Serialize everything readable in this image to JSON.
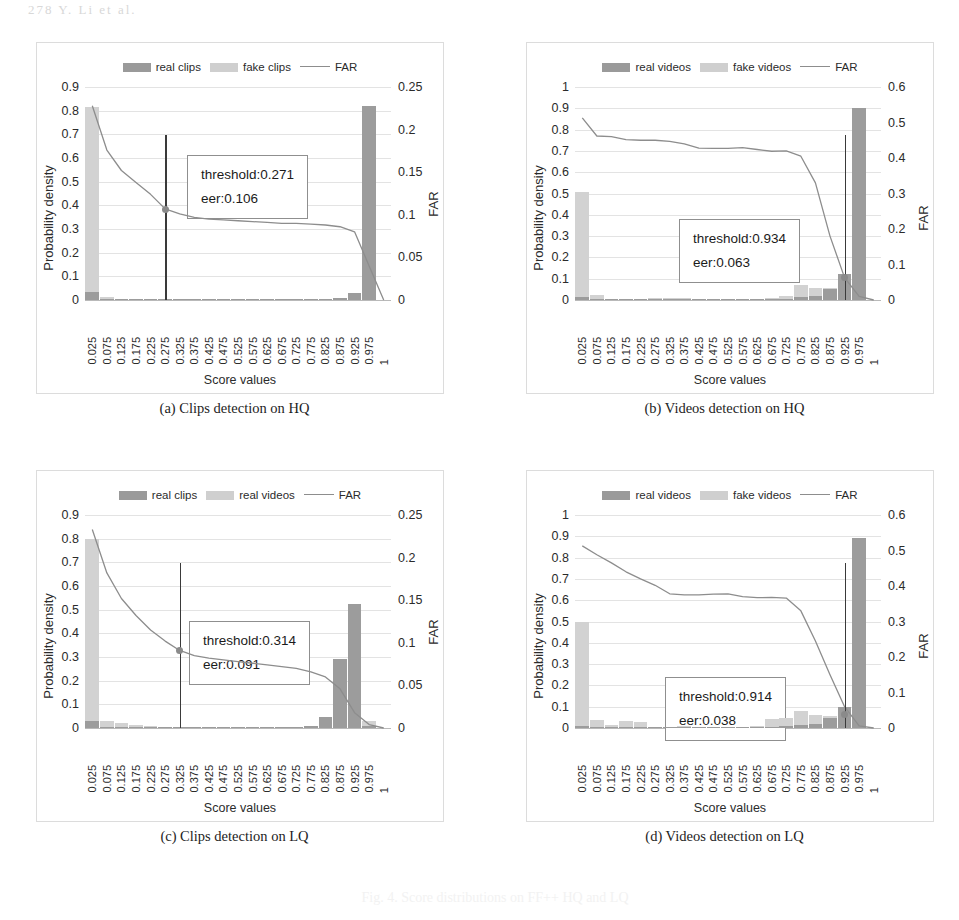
{
  "page": {
    "header_faint": "278         Y. Li et al.",
    "bleed_faint": "Fig. 4. Score distributions on FF++ HQ and LQ"
  },
  "common": {
    "xlabel": "Score values",
    "ylabel_left": "Probability density",
    "ylabel_right": "FAR",
    "xticks": [
      "0.025",
      "0.075",
      "0.125",
      "0.175",
      "0.225",
      "0.275",
      "0.325",
      "0.375",
      "0.425",
      "0.475",
      "0.525",
      "0.575",
      "0.625",
      "0.675",
      "0.725",
      "0.775",
      "0.825",
      "0.875",
      "0.925",
      "0.975",
      "1"
    ],
    "colors": {
      "real_bar": "#9c9c9c",
      "fake_bar": "#d2d2d2",
      "far_line": "#8d8d8d",
      "threshold_line": "#3a3a3a",
      "grid": "#e3e3e3",
      "panel_border": "#dcdcdc"
    }
  },
  "panels": [
    {
      "id": "a",
      "caption": "(a) Clips detection on HQ",
      "legend": [
        "real clips",
        "fake clips",
        "FAR"
      ],
      "threshold_text": "threshold:0.271",
      "eer_text": "eer:0.106",
      "yticks_left": [
        "0.9",
        "0.8",
        "0.7",
        "0.6",
        "0.5",
        "0.4",
        "0.3",
        "0.2",
        "0.1",
        "0"
      ],
      "yticks_right": [
        "0.25",
        "0.2",
        "0.15",
        "0.1",
        "0.05",
        "0"
      ]
    },
    {
      "id": "b",
      "caption": "(b) Videos detection on HQ",
      "legend": [
        "real videos",
        "fake videos",
        "FAR"
      ],
      "threshold_text": "threshold:0.934",
      "eer_text": "eer:0.063",
      "yticks_left": [
        "1",
        "0.9",
        "0.8",
        "0.7",
        "0.6",
        "0.5",
        "0.4",
        "0.3",
        "0.2",
        "0.1",
        "0"
      ],
      "yticks_right": [
        "0.6",
        "0.5",
        "0.4",
        "0.3",
        "0.2",
        "0.1",
        "0"
      ]
    },
    {
      "id": "c",
      "caption": "(c) Clips detection on LQ",
      "legend": [
        "real clips",
        "real videos",
        "FAR"
      ],
      "threshold_text": "threshold:0.314",
      "eer_text": "eer:0.091",
      "yticks_left": [
        "0.9",
        "0.8",
        "0.7",
        "0.6",
        "0.5",
        "0.4",
        "0.3",
        "0.2",
        "0.1",
        "0"
      ],
      "yticks_right": [
        "0.25",
        "0.2",
        "0.15",
        "0.1",
        "0.05",
        "0"
      ]
    },
    {
      "id": "d",
      "caption": "(d) Videos detection on LQ",
      "legend": [
        "real videos",
        "fake videos",
        "FAR"
      ],
      "threshold_text": "threshold:0.914",
      "eer_text": "eer:0.038",
      "yticks_left": [
        "1",
        "0.9",
        "0.8",
        "0.7",
        "0.6",
        "0.5",
        "0.4",
        "0.3",
        "0.2",
        "0.1",
        "0"
      ],
      "yticks_right": [
        "0.6",
        "0.5",
        "0.4",
        "0.3",
        "0.2",
        "0.1",
        "0"
      ]
    }
  ],
  "chart_data": [
    {
      "type": "bar",
      "panel": "a",
      "title": "(a) Clips detection on HQ",
      "xlabel": "Score values",
      "ylabel": "Probability density",
      "ylabel_secondary": "FAR",
      "ylim": [
        0,
        0.9
      ],
      "ylim_secondary": [
        0,
        0.25
      ],
      "grid": true,
      "legend": [
        "real clips",
        "fake clips",
        "FAR"
      ],
      "legend_position": "top-center",
      "categories": [
        "0.025",
        "0.075",
        "0.125",
        "0.175",
        "0.225",
        "0.275",
        "0.325",
        "0.375",
        "0.425",
        "0.475",
        "0.525",
        "0.575",
        "0.625",
        "0.675",
        "0.725",
        "0.775",
        "0.825",
        "0.875",
        "0.925",
        "0.975"
      ],
      "series": [
        {
          "name": "fake clips",
          "values": [
            0.815,
            0.012,
            0.004,
            0.003,
            0.003,
            0.002,
            0.002,
            0.002,
            0.002,
            0.002,
            0.002,
            0.002,
            0.002,
            0.002,
            0.002,
            0.002,
            0.002,
            0.004,
            0.02,
            0.04
          ]
        },
        {
          "name": "real clips",
          "values": [
            0.035,
            0.004,
            0.002,
            0.002,
            0.002,
            0.002,
            0.002,
            0.002,
            0.002,
            0.002,
            0.002,
            0.002,
            0.002,
            0.002,
            0.002,
            0.003,
            0.004,
            0.008,
            0.03,
            0.82
          ]
        }
      ],
      "far_curve": {
        "name": "FAR",
        "axis": "secondary",
        "x": [
          "0.025",
          "0.075",
          "0.125",
          "0.175",
          "0.225",
          "0.275",
          "0.325",
          "0.375",
          "0.425",
          "0.475",
          "0.525",
          "0.575",
          "0.625",
          "0.675",
          "0.725",
          "0.775",
          "0.825",
          "0.875",
          "0.925",
          "0.975",
          "1"
        ],
        "values": [
          0.228,
          0.176,
          0.152,
          0.138,
          0.124,
          0.107,
          0.101,
          0.097,
          0.095,
          0.094,
          0.093,
          0.092,
          0.091,
          0.09,
          0.09,
          0.089,
          0.088,
          0.086,
          0.08,
          0.04,
          0.0
        ]
      },
      "annotations": [
        {
          "text": "threshold:0.271",
          "value": 0.271
        },
        {
          "text": "eer:0.106",
          "value": 0.106
        }
      ],
      "threshold_marker": {
        "x": "0.275",
        "y_secondary": 0.106
      }
    },
    {
      "type": "bar",
      "panel": "b",
      "title": "(b) Videos detection on HQ",
      "xlabel": "Score values",
      "ylabel": "Probability density",
      "ylabel_secondary": "FAR",
      "ylim": [
        0,
        1
      ],
      "ylim_secondary": [
        0,
        0.6
      ],
      "grid": true,
      "legend": [
        "real videos",
        "fake videos",
        "FAR"
      ],
      "legend_position": "top-center",
      "categories": [
        "0.025",
        "0.075",
        "0.125",
        "0.175",
        "0.225",
        "0.275",
        "0.325",
        "0.375",
        "0.425",
        "0.475",
        "0.525",
        "0.575",
        "0.625",
        "0.675",
        "0.725",
        "0.775",
        "0.825",
        "0.875",
        "0.925",
        "0.975"
      ],
      "series": [
        {
          "name": "fake videos",
          "values": [
            0.505,
            0.022,
            0.004,
            0.004,
            0.004,
            0.01,
            0.01,
            0.01,
            0.006,
            0.004,
            0.004,
            0.004,
            0.004,
            0.008,
            0.02,
            0.072,
            0.055,
            0.055,
            0.035,
            0.01
          ]
        },
        {
          "name": "real videos",
          "values": [
            0.012,
            0.004,
            0.002,
            0.002,
            0.002,
            0.004,
            0.004,
            0.004,
            0.003,
            0.003,
            0.003,
            0.003,
            0.003,
            0.004,
            0.006,
            0.012,
            0.02,
            0.05,
            0.12,
            0.9
          ]
        }
      ],
      "far_curve": {
        "name": "FAR",
        "axis": "secondary",
        "x": [
          "0.025",
          "0.075",
          "0.125",
          "0.175",
          "0.225",
          "0.275",
          "0.325",
          "0.375",
          "0.425",
          "0.475",
          "0.525",
          "0.575",
          "0.625",
          "0.675",
          "0.725",
          "0.775",
          "0.825",
          "0.875",
          "0.925",
          "0.975",
          "1"
        ],
        "values": [
          0.513,
          0.462,
          0.46,
          0.452,
          0.45,
          0.45,
          0.447,
          0.44,
          0.428,
          0.427,
          0.427,
          0.429,
          0.424,
          0.419,
          0.42,
          0.405,
          0.33,
          0.18,
          0.063,
          0.01,
          0.0
        ]
      },
      "annotations": [
        {
          "text": "threshold:0.934",
          "value": 0.934
        },
        {
          "text": "eer:0.063",
          "value": 0.063
        }
      ],
      "threshold_marker": {
        "x": "0.925",
        "y_secondary": 0.063
      }
    },
    {
      "type": "bar",
      "panel": "c",
      "title": "(c) Clips detection on LQ",
      "xlabel": "Score values",
      "ylabel": "Probability density",
      "ylabel_secondary": "FAR",
      "ylim": [
        0,
        0.9
      ],
      "ylim_secondary": [
        0,
        0.25
      ],
      "grid": true,
      "legend": [
        "real clips",
        "real videos",
        "FAR"
      ],
      "legend_position": "top-center",
      "categories": [
        "0.025",
        "0.075",
        "0.125",
        "0.175",
        "0.225",
        "0.275",
        "0.325",
        "0.375",
        "0.425",
        "0.475",
        "0.525",
        "0.575",
        "0.625",
        "0.675",
        "0.725",
        "0.775",
        "0.825",
        "0.875",
        "0.925",
        "0.975"
      ],
      "series": [
        {
          "name": "real videos",
          "values": [
            0.8,
            0.028,
            0.022,
            0.014,
            0.008,
            0.006,
            0.004,
            0.004,
            0.004,
            0.006,
            0.004,
            0.004,
            0.003,
            0.003,
            0.004,
            0.008,
            0.01,
            0.04,
            0.09,
            0.03
          ]
        },
        {
          "name": "real clips",
          "values": [
            0.03,
            0.006,
            0.004,
            0.003,
            0.003,
            0.003,
            0.003,
            0.003,
            0.003,
            0.004,
            0.003,
            0.003,
            0.003,
            0.003,
            0.004,
            0.008,
            0.045,
            0.29,
            0.525,
            0.01
          ]
        }
      ],
      "far_curve": {
        "name": "FAR",
        "axis": "secondary",
        "x": [
          "0.025",
          "0.075",
          "0.125",
          "0.175",
          "0.225",
          "0.275",
          "0.325",
          "0.375",
          "0.425",
          "0.475",
          "0.525",
          "0.575",
          "0.625",
          "0.675",
          "0.725",
          "0.775",
          "0.825",
          "0.875",
          "0.925",
          "0.975",
          "1"
        ],
        "values": [
          0.233,
          0.182,
          0.152,
          0.132,
          0.115,
          0.102,
          0.091,
          0.085,
          0.082,
          0.08,
          0.078,
          0.076,
          0.074,
          0.072,
          0.07,
          0.066,
          0.06,
          0.046,
          0.018,
          0.004,
          0.0
        ]
      },
      "annotations": [
        {
          "text": "threshold:0.314",
          "value": 0.314
        },
        {
          "text": "eer:0.091",
          "value": 0.091
        }
      ],
      "threshold_marker": {
        "x": "0.325",
        "y_secondary": 0.091
      }
    },
    {
      "type": "bar",
      "panel": "d",
      "title": "(d) Videos detection on LQ",
      "xlabel": "Score values",
      "ylabel": "Probability density",
      "ylabel_secondary": "FAR",
      "ylim": [
        0,
        1
      ],
      "ylim_secondary": [
        0,
        0.6
      ],
      "grid": true,
      "legend": [
        "real videos",
        "fake videos",
        "FAR"
      ],
      "legend_position": "top-center",
      "categories": [
        "0.025",
        "0.075",
        "0.125",
        "0.175",
        "0.225",
        "0.275",
        "0.325",
        "0.375",
        "0.425",
        "0.475",
        "0.525",
        "0.575",
        "0.625",
        "0.675",
        "0.725",
        "0.775",
        "0.825",
        "0.875",
        "0.925",
        "0.975"
      ],
      "series": [
        {
          "name": "fake videos",
          "values": [
            0.5,
            0.038,
            0.012,
            0.032,
            0.03,
            0.006,
            0.004,
            0.008,
            0.006,
            0.006,
            0.006,
            0.006,
            0.008,
            0.04,
            0.045,
            0.078,
            0.06,
            0.055,
            0.04,
            0.006
          ]
        },
        {
          "name": "real videos",
          "values": [
            0.01,
            0.004,
            0.003,
            0.003,
            0.003,
            0.003,
            0.003,
            0.004,
            0.003,
            0.003,
            0.003,
            0.003,
            0.004,
            0.006,
            0.008,
            0.012,
            0.02,
            0.045,
            0.1,
            0.89
          ]
        }
      ],
      "far_curve": {
        "name": "FAR",
        "axis": "secondary",
        "x": [
          "0.025",
          "0.075",
          "0.125",
          "0.175",
          "0.225",
          "0.275",
          "0.325",
          "0.375",
          "0.425",
          "0.475",
          "0.525",
          "0.575",
          "0.625",
          "0.675",
          "0.725",
          "0.775",
          "0.825",
          "0.875",
          "0.925",
          "0.975",
          "1"
        ],
        "values": [
          0.513,
          0.488,
          0.465,
          0.44,
          0.42,
          0.402,
          0.378,
          0.375,
          0.375,
          0.377,
          0.378,
          0.37,
          0.367,
          0.368,
          0.366,
          0.33,
          0.245,
          0.15,
          0.06,
          0.006,
          0.0
        ]
      },
      "annotations": [
        {
          "text": "threshold:0.914",
          "value": 0.914
        },
        {
          "text": "eer:0.038",
          "value": 0.038
        }
      ],
      "threshold_marker": {
        "x": "0.925",
        "y_secondary": 0.038
      }
    }
  ]
}
